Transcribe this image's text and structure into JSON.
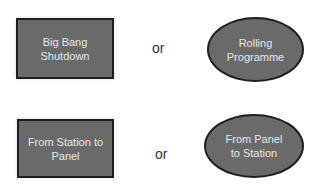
{
  "rows": [
    {
      "left": {
        "shape": "rectangle",
        "label": "Big Bang Shutdown",
        "lines": [
          "Big Bang",
          "Shutdown"
        ]
      },
      "connector": "or",
      "right": {
        "shape": "ellipse",
        "label": "Rolling Programme",
        "lines": [
          "Rolling",
          "Programme"
        ]
      }
    },
    {
      "left": {
        "shape": "rectangle",
        "label": "From Station to Panel",
        "lines": [
          "From Station to",
          "Panel"
        ]
      },
      "connector": "or",
      "right": {
        "shape": "ellipse",
        "label": "From Panel to Station",
        "lines": [
          "From Panel",
          "to Station"
        ]
      }
    }
  ],
  "colors": {
    "fill": "#6a6a6a",
    "border": "#1e1e1e",
    "text": "#e8e8e8",
    "connector_text": "#333333"
  }
}
